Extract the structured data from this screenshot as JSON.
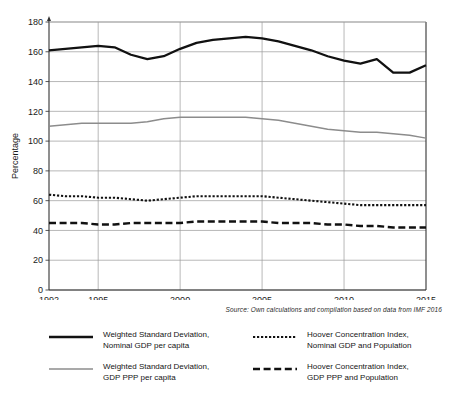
{
  "chart_data": {
    "type": "line",
    "title": "",
    "xlabel": "",
    "ylabel": "Percentage",
    "xlim": [
      1992,
      2015
    ],
    "ylim": [
      0,
      180
    ],
    "grid": true,
    "legend_position": "bottom",
    "x": [
      1992,
      1993,
      1994,
      1995,
      1996,
      1997,
      1998,
      1999,
      2000,
      2001,
      2002,
      2003,
      2004,
      2005,
      2006,
      2007,
      2008,
      2009,
      2010,
      2011,
      2012,
      2013,
      2014,
      2015
    ],
    "xticks": [
      "1992",
      "1995",
      "2000",
      "2005",
      "2010",
      "2015"
    ],
    "yticks": [
      "0",
      "20",
      "40",
      "60",
      "80",
      "100",
      "120",
      "140",
      "160",
      "180"
    ],
    "series": [
      {
        "name": "Weighted Standard Deviation, Nominal GDP per capita",
        "style": "solid-thick",
        "color": "#111111",
        "values": [
          161,
          162,
          163,
          164,
          163,
          158,
          155,
          157,
          162,
          166,
          168,
          169,
          170,
          169,
          167,
          164,
          161,
          157,
          154,
          152,
          155,
          146,
          146,
          151
        ]
      },
      {
        "name": "Weighted Standard Deviation, GDP PPP per capita",
        "style": "solid-thin-gray",
        "color": "#8c8c8c",
        "values": [
          110,
          111,
          112,
          112,
          112,
          112,
          113,
          115,
          116,
          116,
          116,
          116,
          116,
          115,
          114,
          112,
          110,
          108,
          107,
          106,
          106,
          105,
          104,
          102
        ]
      },
      {
        "name": "Hoover Concentration Index, Nominal GDP and Population",
        "style": "dotted",
        "color": "#111111",
        "values": [
          64,
          63,
          63,
          62,
          62,
          61,
          60,
          61,
          62,
          63,
          63,
          63,
          63,
          63,
          62,
          61,
          60,
          59,
          58,
          57,
          57,
          57,
          57,
          57
        ]
      },
      {
        "name": "Hoover Concentration Index, GDP PPP and Population",
        "style": "dashed",
        "color": "#111111",
        "values": [
          45,
          45,
          45,
          44,
          44,
          45,
          45,
          45,
          45,
          46,
          46,
          46,
          46,
          46,
          45,
          45,
          45,
          44,
          44,
          43,
          43,
          42,
          42,
          42
        ]
      }
    ]
  },
  "axis": {
    "y_title": "Percentage"
  },
  "source": {
    "text": "Source: Own calculations and compilation based on data from IMF 2016"
  },
  "legend": {
    "items": [
      {
        "label": "Weighted Standard Deviation,\nNominal GDP per capita",
        "style": "solid-thick",
        "color": "#111111"
      },
      {
        "label": "Hoover Concentration Index,\nNominal GDP and Population",
        "style": "dotted",
        "color": "#111111"
      },
      {
        "label": "Weighted Standard Deviation,\nGDP PPP per capita",
        "style": "solid-thin-gray",
        "color": "#8c8c8c"
      },
      {
        "label": "Hoover Concentration Index,\nGDP PPP and Population",
        "style": "dashed",
        "color": "#111111"
      }
    ]
  }
}
